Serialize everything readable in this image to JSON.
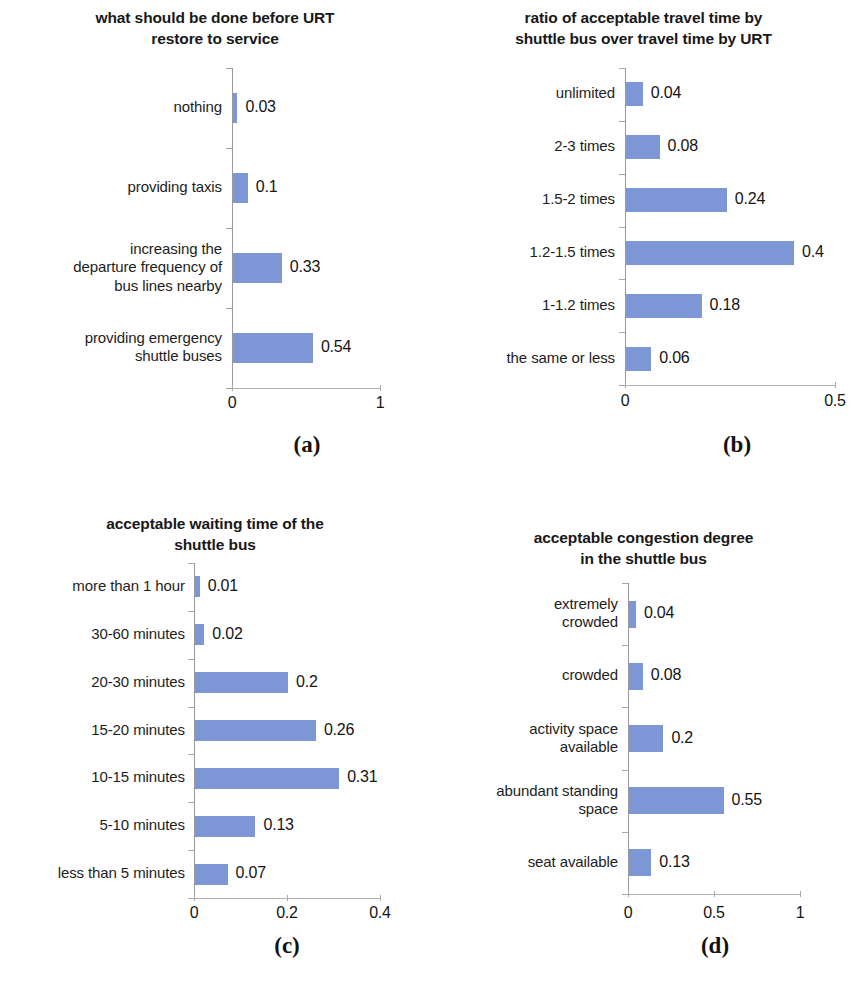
{
  "figure": {
    "bar_color": "#7d97d6",
    "axis_color": "#a8a8a8",
    "text_color": "#1a1a1a"
  },
  "panels": [
    {
      "caption": "(a)",
      "title": "what should be done before URT\nrestore to service",
      "axis_ticks": [
        "0",
        "1"
      ],
      "categories": [
        {
          "label": "nothing",
          "value": "0.03"
        },
        {
          "label": "providing taxis",
          "value": "0.1"
        },
        {
          "label": "increasing the\ndeparture frequency of\nbus lines nearby",
          "value": "0.33"
        },
        {
          "label": "providing emergency\nshuttle buses",
          "value": "0.54"
        }
      ]
    },
    {
      "caption": "(b)",
      "title": "ratio of acceptable travel time by\nshuttle bus over travel time by URT",
      "axis_ticks": [
        "0",
        "0.5"
      ],
      "categories": [
        {
          "label": "unlimited",
          "value": "0.04"
        },
        {
          "label": "2-3 times",
          "value": "0.08"
        },
        {
          "label": "1.5-2 times",
          "value": "0.24"
        },
        {
          "label": "1.2-1.5 times",
          "value": "0.4"
        },
        {
          "label": "1-1.2 times",
          "value": "0.18"
        },
        {
          "label": "the same or less",
          "value": "0.06"
        }
      ]
    },
    {
      "caption": "(c)",
      "title": "acceptable waiting time of the\nshuttle bus",
      "axis_ticks": [
        "0",
        "0.2",
        "0.4"
      ],
      "categories": [
        {
          "label": "more than 1 hour",
          "value": "0.01"
        },
        {
          "label": "30-60 minutes",
          "value": "0.02"
        },
        {
          "label": "20-30 minutes",
          "value": "0.2"
        },
        {
          "label": "15-20 minutes",
          "value": "0.26"
        },
        {
          "label": "10-15 minutes",
          "value": "0.31"
        },
        {
          "label": "5-10 minutes",
          "value": "0.13"
        },
        {
          "label": "less than 5 minutes",
          "value": "0.07"
        }
      ]
    },
    {
      "caption": "(d)",
      "title": "acceptable congestion degree\nin the shuttle bus",
      "axis_ticks": [
        "0",
        "0.5",
        "1"
      ],
      "categories": [
        {
          "label": "extremely\ncrowded",
          "value": "0.04"
        },
        {
          "label": "crowded",
          "value": "0.08"
        },
        {
          "label": "activity space\navailable",
          "value": "0.2"
        },
        {
          "label": "abundant standing\nspace",
          "value": "0.55"
        },
        {
          "label": "seat available",
          "value": "0.13"
        }
      ]
    }
  ],
  "chart_data": [
    {
      "type": "bar",
      "orientation": "horizontal",
      "panel": "(a)",
      "title": "what should be done before URT restore to service",
      "xlabel": "",
      "ylabel": "",
      "xlim": [
        0,
        1
      ],
      "xticks": [
        0,
        1
      ],
      "grid": false,
      "legend": null,
      "categories": [
        "nothing",
        "providing taxis",
        "increasing the departure frequency of bus lines nearby",
        "providing emergency shuttle buses"
      ],
      "values": [
        0.03,
        0.1,
        0.33,
        0.54
      ],
      "data_labels": [
        "0.03",
        "0.1",
        "0.33",
        "0.54"
      ]
    },
    {
      "type": "bar",
      "orientation": "horizontal",
      "panel": "(b)",
      "title": "ratio of acceptable travel time by shuttle bus over travel time by URT",
      "xlabel": "",
      "ylabel": "",
      "xlim": [
        0,
        0.5
      ],
      "xticks": [
        0,
        0.5
      ],
      "grid": false,
      "legend": null,
      "categories": [
        "unlimited",
        "2-3 times",
        "1.5-2 times",
        "1.2-1.5 times",
        "1-1.2 times",
        "the same or less"
      ],
      "values": [
        0.04,
        0.08,
        0.24,
        0.4,
        0.18,
        0.06
      ],
      "data_labels": [
        "0.04",
        "0.08",
        "0.24",
        "0.4",
        "0.18",
        "0.06"
      ]
    },
    {
      "type": "bar",
      "orientation": "horizontal",
      "panel": "(c)",
      "title": "acceptable waiting time of the shuttle bus",
      "xlabel": "",
      "ylabel": "",
      "xlim": [
        0,
        0.4
      ],
      "xticks": [
        0,
        0.2,
        0.4
      ],
      "grid": false,
      "legend": null,
      "categories": [
        "more than 1 hour",
        "30-60 minutes",
        "20-30 minutes",
        "15-20 minutes",
        "10-15 minutes",
        "5-10 minutes",
        "less than 5 minutes"
      ],
      "values": [
        0.01,
        0.02,
        0.2,
        0.26,
        0.31,
        0.13,
        0.07
      ],
      "data_labels": [
        "0.01",
        "0.02",
        "0.2",
        "0.26",
        "0.31",
        "0.13",
        "0.07"
      ]
    },
    {
      "type": "bar",
      "orientation": "horizontal",
      "panel": "(d)",
      "title": "acceptable congestion degree in the shuttle bus",
      "xlabel": "",
      "ylabel": "",
      "xlim": [
        0,
        1
      ],
      "xticks": [
        0,
        0.5,
        1
      ],
      "grid": false,
      "legend": null,
      "categories": [
        "extremely crowded",
        "crowded",
        "activity space available",
        "abundant standing space",
        "seat available"
      ],
      "values": [
        0.04,
        0.08,
        0.2,
        0.55,
        0.13
      ],
      "data_labels": [
        "0.04",
        "0.08",
        "0.2",
        "0.55",
        "0.13"
      ]
    }
  ],
  "layout": [
    {
      "id": "a",
      "plot": {
        "left": 232,
        "top": 68,
        "width": 148,
        "height": 320
      },
      "axis_max": 1,
      "bar_thickness": 30,
      "label_right": 222,
      "caption_x": 307,
      "caption_y": 432,
      "tick_label_y": 394,
      "tick_positions": [
        0,
        1
      ]
    },
    {
      "id": "b",
      "plot": {
        "left": 195,
        "top": 68,
        "width": 210,
        "height": 317
      },
      "axis_max": 0.5,
      "bar_thickness": 24,
      "label_right": 185,
      "caption_x": 307,
      "caption_y": 432,
      "tick_label_y": 392,
      "tick_positions": [
        0,
        0.5
      ]
    },
    {
      "id": "c",
      "plot": {
        "left": 194,
        "top": 67,
        "width": 186,
        "height": 335
      },
      "axis_max": 0.4,
      "bar_thickness": 21,
      "label_right": 185,
      "caption_x": 287,
      "caption_y": 437,
      "tick_label_y": 408,
      "tick_positions": [
        0,
        0.2,
        0.4
      ]
    },
    {
      "id": "d",
      "plot": {
        "left": 198,
        "top": 87,
        "width": 172,
        "height": 311
      },
      "axis_max": 1,
      "bar_thickness": 27,
      "label_right": 188,
      "caption_x": 285,
      "caption_y": 437,
      "tick_label_y": 408,
      "tick_positions": [
        0,
        0.5,
        1
      ]
    }
  ]
}
